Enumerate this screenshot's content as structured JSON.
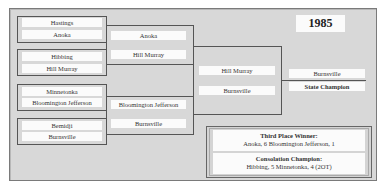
{
  "year": "1985",
  "quarterfinals": [
    {
      "team_a": "Hastings",
      "team_b": "Anoka"
    },
    {
      "team_a": "Hibbing",
      "team_b": "Hill Murray"
    },
    {
      "team_a": "Minnetonka",
      "team_b": "Bloomington Jefferson"
    },
    {
      "team_a": "Bemidji",
      "team_b": "Burnsville"
    }
  ],
  "semifinals": [
    {
      "team_a": "Anoka",
      "team_b": "Hill Murray"
    },
    {
      "team_a": "Bloomington Jefferson",
      "team_b": "Burnsville"
    }
  ],
  "final": {
    "team_a": "Hill Murray",
    "team_b": "Burnsville"
  },
  "champion": {
    "team": "Burnsville",
    "label": "State Champion"
  },
  "third_place": {
    "title": "Third Place Winner:",
    "result": "Anoka, 6   Bloomington Jefferson, 1"
  },
  "consolation": {
    "title": "Consolation Champion:",
    "result": "Hibbing, 5  Minnetonka, 4 (2OT)"
  },
  "colors": {
    "background": "#d8d8d8",
    "bar": "#fbfbfb",
    "line": "#555555"
  }
}
